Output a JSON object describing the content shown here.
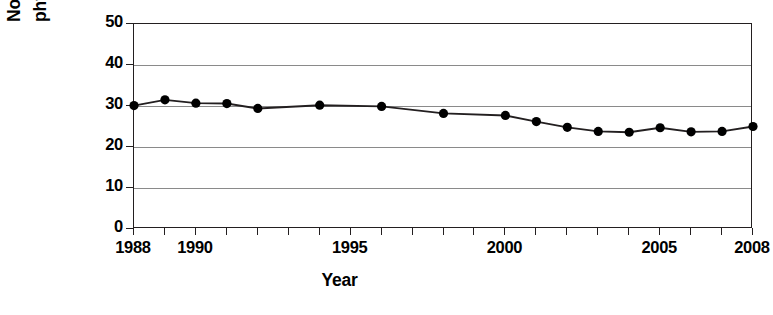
{
  "chart_data": {
    "type": "line",
    "title": "",
    "xlabel": "Year",
    "ylabel": "No leisure-time physical activity (%)",
    "ylabel_lines": [
      "No leisure-time",
      "physical activity (%)"
    ],
    "xlim": [
      1988,
      2008
    ],
    "ylim": [
      0,
      50
    ],
    "ytick_values": [
      50,
      40,
      30,
      20,
      10,
      0
    ],
    "ytick_labels": [
      "50",
      "40",
      "30",
      "20",
      "10",
      "0"
    ],
    "xtick_values": [
      1988,
      1989,
      1990,
      1991,
      1992,
      1993,
      1994,
      1995,
      1996,
      1997,
      1998,
      1999,
      2000,
      2001,
      2002,
      2003,
      2004,
      2005,
      2006,
      2007,
      2008
    ],
    "xtick_labels": [
      {
        "value": 1988,
        "label": "1988"
      },
      {
        "value": 1990,
        "label": "1990"
      },
      {
        "value": 1995,
        "label": "1995"
      },
      {
        "value": 2000,
        "label": "2000"
      },
      {
        "value": 2005,
        "label": "2005"
      },
      {
        "value": 2008,
        "label": "2008"
      }
    ],
    "grid": true,
    "grid_axis": "y",
    "legend": false,
    "marker": "filled-circle",
    "line_color": "#231f20",
    "marker_color": "#000000",
    "x": [
      1988,
      1989,
      1990,
      1991,
      1992,
      1994,
      1996,
      1998,
      2000,
      2001,
      2002,
      2003,
      2004,
      2005,
      2006,
      2007,
      2008
    ],
    "values": [
      30.1,
      31.5,
      30.7,
      30.6,
      29.4,
      30.2,
      29.9,
      28.2,
      27.7,
      26.2,
      24.8,
      23.8,
      23.6,
      24.7,
      23.7,
      23.8,
      25.0
    ],
    "series": [
      {
        "name": "No leisure-time physical activity",
        "points": [
          {
            "x": 1988,
            "y": 30.1
          },
          {
            "x": 1989,
            "y": 31.5
          },
          {
            "x": 1990,
            "y": 30.7
          },
          {
            "x": 1991,
            "y": 30.6
          },
          {
            "x": 1992,
            "y": 29.4
          },
          {
            "x": 1994,
            "y": 30.2
          },
          {
            "x": 1996,
            "y": 29.9
          },
          {
            "x": 1998,
            "y": 28.2
          },
          {
            "x": 2000,
            "y": 27.7
          },
          {
            "x": 2001,
            "y": 26.2
          },
          {
            "x": 2002,
            "y": 24.8
          },
          {
            "x": 2003,
            "y": 23.8
          },
          {
            "x": 2004,
            "y": 23.6
          },
          {
            "x": 2005,
            "y": 24.7
          },
          {
            "x": 2006,
            "y": 23.7
          },
          {
            "x": 2007,
            "y": 23.8
          },
          {
            "x": 2008,
            "y": 25.0
          }
        ]
      }
    ]
  }
}
